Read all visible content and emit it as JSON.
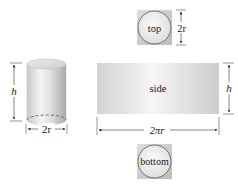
{
  "diagram": {
    "cylinder": {
      "height_label": "h",
      "diameter_label": "2r"
    },
    "top": {
      "label": "top",
      "dimension_label": "2r"
    },
    "side": {
      "label": "side",
      "height_label": "h",
      "width_label": "2πr"
    },
    "bottom": {
      "label": "bottom"
    }
  }
}
